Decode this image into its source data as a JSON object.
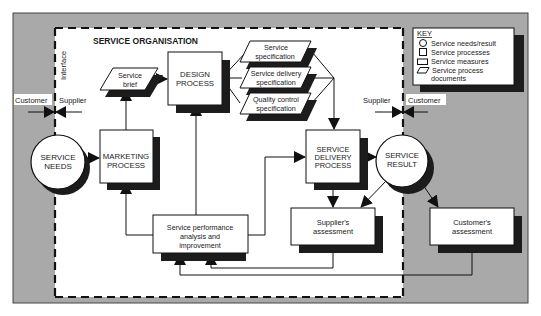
{
  "diagram": {
    "title": "SERVICE ORGANISATION",
    "interface_label": "Interface",
    "left_boundary": {
      "customer": "Customer",
      "supplier": "Supplier"
    },
    "right_boundary": {
      "supplier": "Supplier",
      "customer": "Customer"
    },
    "nodes": {
      "service_needs": {
        "line1": "SERVICE",
        "line2": "NEEDS",
        "type": "circle"
      },
      "marketing_process": {
        "line1": "MARKETING",
        "line2": "PROCESS",
        "type": "process"
      },
      "service_brief": {
        "line1": "Service",
        "line2": "brief",
        "type": "document"
      },
      "design_process": {
        "line1": "DESIGN",
        "line2": "PROCESS",
        "type": "process"
      },
      "service_specification": {
        "line1": "Service",
        "line2": "specification",
        "type": "document"
      },
      "service_delivery_specification": {
        "line1": "Service delivery",
        "line2": "specification",
        "type": "document"
      },
      "quality_control_specification": {
        "line1": "Quality control",
        "line2": "specification",
        "type": "document"
      },
      "service_delivery_process": {
        "line1": "SERVICE",
        "line2": "DELIVERY",
        "line3": "PROCESS",
        "type": "process"
      },
      "service_result": {
        "line1": "SERVICE",
        "line2": "RESULT",
        "type": "circle"
      },
      "suppliers_assessment": {
        "line1": "Supplier's",
        "line2": "assessment",
        "type": "measure"
      },
      "customers_assessment": {
        "line1": "Customer's",
        "line2": "assessment",
        "type": "measure"
      },
      "service_performance": {
        "line1": "Service performance",
        "line2": "analysis and",
        "line3": "improvement",
        "type": "measure"
      }
    },
    "key": {
      "title": "KEY",
      "items": [
        {
          "shape": "circle",
          "label": "Service needs/result"
        },
        {
          "shape": "square",
          "label": "Service processes"
        },
        {
          "shape": "rectangle",
          "label": "Service measures"
        },
        {
          "shape": "parallelogram",
          "label": "Service process",
          "label2": "documents"
        }
      ]
    },
    "colors": {
      "outside": "#a9a9a9",
      "inside": "#ffffff",
      "shadow": "#1c1c1c",
      "line": "#111111"
    }
  }
}
